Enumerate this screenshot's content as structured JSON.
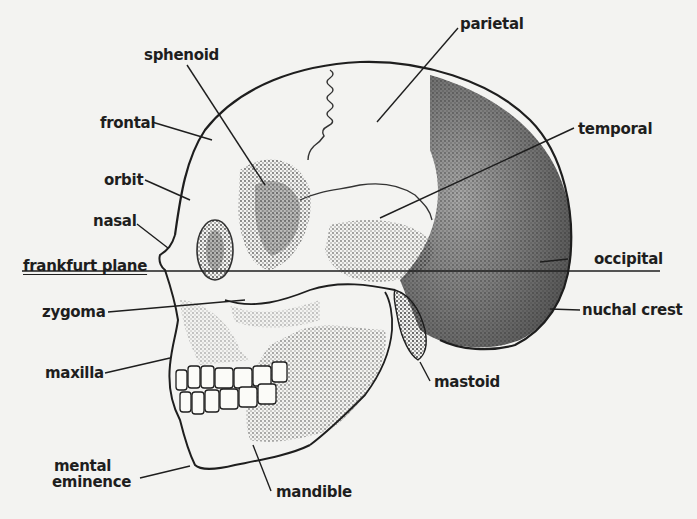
{
  "diagram": {
    "colors": {
      "ink": "#1e1e1e",
      "paper": "#f3f3f1",
      "shade": "#6a6a6a"
    },
    "labels": [
      {
        "id": "sphenoid",
        "text": "sphenoid"
      },
      {
        "id": "parietal",
        "text": "parietal"
      },
      {
        "id": "frontal",
        "text": "frontal"
      },
      {
        "id": "temporal",
        "text": "temporal"
      },
      {
        "id": "orbit",
        "text": "orbit"
      },
      {
        "id": "nasal",
        "text": "nasal"
      },
      {
        "id": "frankfurt_plane",
        "text": "frankfurt plane"
      },
      {
        "id": "occipital",
        "text": "occipital"
      },
      {
        "id": "zygoma",
        "text": "zygoma"
      },
      {
        "id": "nuchal_crest",
        "text": "nuchal crest"
      },
      {
        "id": "maxilla",
        "text": "maxilla"
      },
      {
        "id": "mastoid",
        "text": "mastoid"
      },
      {
        "id": "mental_eminence_line1",
        "text": "mental"
      },
      {
        "id": "mental_eminence_line2",
        "text": "eminence"
      },
      {
        "id": "mandible",
        "text": "mandible"
      }
    ]
  }
}
